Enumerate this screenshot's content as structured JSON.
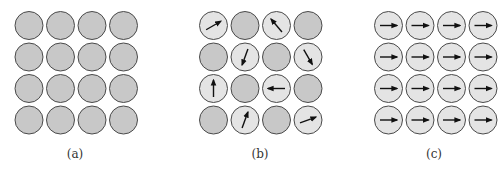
{
  "colors": {
    "disordered_fill": "#c8c8c8",
    "spin_fill": "#e4e4e4",
    "stroke": "#4a4a4a",
    "arrow": "#111111"
  },
  "panels": [
    {
      "id": "a",
      "label": "(a)",
      "description": "4x4 grid of non-magnetic atoms (no spins)",
      "grid": [
        [
          null,
          null,
          null,
          null
        ],
        [
          null,
          null,
          null,
          null
        ],
        [
          null,
          null,
          null,
          null
        ],
        [
          null,
          null,
          null,
          null
        ]
      ]
    },
    {
      "id": "b",
      "label": "(b)",
      "description": "Paramagnetic: randomly oriented spins on some atoms",
      "grid": [
        [
          30,
          null,
          130,
          null
        ],
        [
          250,
          null,
          null,
          300
        ],
        [
          90,
          null,
          180,
          null
        ],
        [
          null,
          70,
          null,
          20
        ]
      ],
      "grid_note": "angles in degrees, 0=right, counter-clockwise; null = no spin",
      "grid_fixed": [
        [
          30,
          null,
          130,
          null
        ],
        [
          null,
          250,
          null,
          300
        ],
        [
          90,
          null,
          180,
          null
        ],
        [
          null,
          70,
          null,
          20
        ]
      ]
    },
    {
      "id": "c",
      "label": "(c)",
      "description": "Ferromagnetic: all spins aligned to the right",
      "grid": [
        [
          0,
          0,
          0,
          0
        ],
        [
          0,
          0,
          0,
          0
        ],
        [
          0,
          0,
          0,
          0
        ],
        [
          0,
          0,
          0,
          0
        ]
      ]
    }
  ]
}
